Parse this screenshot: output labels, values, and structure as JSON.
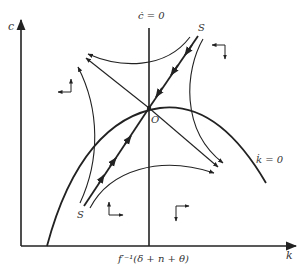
{
  "diagram": {
    "type": "phase-diagram",
    "axes": {
      "y_label": "c",
      "x_label": "k"
    },
    "loci": {
      "c_dot_zero": "ċ = 0",
      "k_dot_zero": "k̇ = 0"
    },
    "points": {
      "origin_label": "O",
      "saddle_upper": "S",
      "saddle_lower": "S"
    },
    "x_tick_label": "f′⁻¹(δ + n + θ)",
    "colors": {
      "line": "#222222",
      "text": "#333333",
      "background": "#ffffff"
    }
  }
}
